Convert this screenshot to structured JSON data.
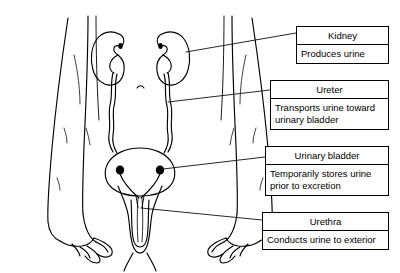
{
  "diagram": {
    "organs": [
      {
        "name": "right-kidney",
        "icon": "kidney-icon"
      },
      {
        "name": "left-kidney",
        "icon": "kidney-icon"
      },
      {
        "name": "right-ureter",
        "icon": "ureter-icon"
      },
      {
        "name": "left-ureter",
        "icon": "ureter-icon"
      },
      {
        "name": "urinary-bladder",
        "icon": "bladder-icon"
      },
      {
        "name": "urethra",
        "icon": "urethra-icon"
      },
      {
        "name": "body-outline",
        "icon": "torso-arms-icon"
      }
    ]
  },
  "callouts": [
    {
      "id": "kidney",
      "title": "Kidney",
      "desc": "Produces urine"
    },
    {
      "id": "ureter",
      "title": "Ureter",
      "desc": "Transports urine toward urinary bladder"
    },
    {
      "id": "bladder",
      "title": "Urinary bladder",
      "desc": "Temporarily stores urine prior to excretion"
    },
    {
      "id": "urethra",
      "title": "Urethra",
      "desc": "Conducts urine to exterior"
    }
  ],
  "style": {
    "ink": "#000000",
    "paper": "#ffffff"
  }
}
